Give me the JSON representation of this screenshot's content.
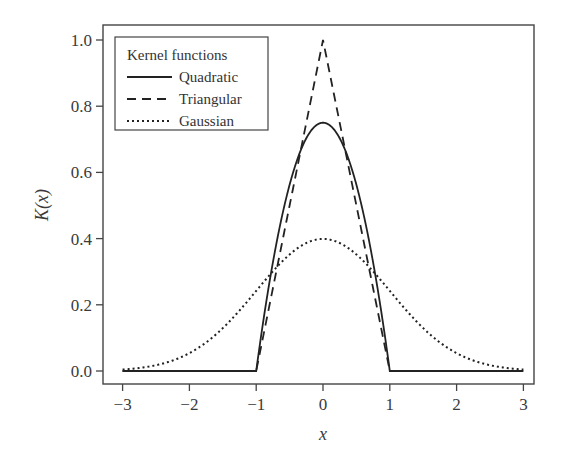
{
  "chart_data": {
    "type": "line",
    "title": "",
    "xlabel": "x",
    "ylabel": "K(x)",
    "xlim": [
      -3.2,
      3.2
    ],
    "ylim": [
      -0.035,
      1.05
    ],
    "x_ticks": [
      -3,
      -2,
      -1,
      0,
      1,
      2,
      3
    ],
    "x_tick_labels": [
      "−3",
      "−2",
      "−1",
      "0",
      "1",
      "2",
      "3"
    ],
    "y_ticks": [
      0.0,
      0.2,
      0.4,
      0.6,
      0.8,
      1.0
    ],
    "y_tick_labels": [
      "0.0",
      "0.2",
      "0.4",
      "0.6",
      "0.8",
      "1.0"
    ],
    "grid": false,
    "legend": {
      "title": "Kernel functions",
      "position": "upper left",
      "entries": [
        "Quadratic",
        "Triangular",
        "Gaussian"
      ]
    },
    "series": [
      {
        "name": "Quadratic",
        "style": "solid",
        "formula": "0.75*(1-x^2) for |x|<=1, else 0",
        "x": [
          -3,
          -1,
          -0.8,
          -0.6,
          -0.4,
          -0.2,
          0,
          0.2,
          0.4,
          0.6,
          0.8,
          1,
          3
        ],
        "values": [
          0,
          0,
          0.27,
          0.48,
          0.63,
          0.72,
          0.75,
          0.72,
          0.63,
          0.48,
          0.27,
          0,
          0
        ]
      },
      {
        "name": "Triangular",
        "style": "dashed",
        "formula": "1-|x| for |x|<=1, else 0",
        "x": [
          -3,
          -1,
          -0.5,
          0,
          0.5,
          1,
          3
        ],
        "values": [
          0,
          0,
          0.5,
          1.0,
          0.5,
          0,
          0
        ]
      },
      {
        "name": "Gaussian",
        "style": "dotted",
        "formula": "exp(-x^2/2)/sqrt(2*pi)",
        "x": [
          -3,
          -2.5,
          -2,
          -1.5,
          -1,
          -0.5,
          0,
          0.5,
          1,
          1.5,
          2,
          2.5,
          3
        ],
        "values": [
          0.004,
          0.018,
          0.054,
          0.13,
          0.242,
          0.352,
          0.399,
          0.352,
          0.242,
          0.13,
          0.054,
          0.018,
          0.004
        ]
      }
    ]
  },
  "layout": {
    "frame": {
      "left": 103,
      "top": 25,
      "right": 534,
      "bottom": 384
    },
    "x0_px": 323,
    "x_unit_px": 66.8,
    "y0_px": 371,
    "y_unit_px": 331,
    "line_color": "#222222",
    "frame_color": "#444444"
  }
}
